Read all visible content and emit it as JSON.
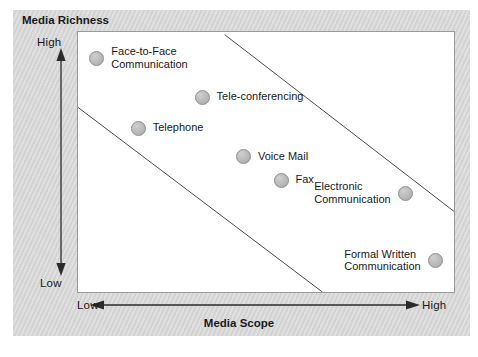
{
  "figure": {
    "richness_axis_title": "Media Richness",
    "scope_axis_title": "Media Scope",
    "y_high": "High",
    "y_low": "Low",
    "x_low": "Low",
    "x_high": "High",
    "caption": "",
    "colors": {
      "frame": "#d6d6d6",
      "panel": "#ffffff",
      "panel_border": "#9a9a9a",
      "marker_fill": "#b8b8b8",
      "marker_border": "#8e8e8e",
      "line": "#4d4d4d",
      "text": "#1a1a1a"
    }
  },
  "chart_data": {
    "type": "scatter",
    "title": "",
    "xlabel": "Media Scope",
    "ylabel": "Media Richness",
    "xlim": [
      "Low",
      "High"
    ],
    "ylim": [
      "Low",
      "High"
    ],
    "xticklabels": [
      "Low",
      "High"
    ],
    "yticklabels": [
      "Low",
      "High"
    ],
    "grid": false,
    "legend": "none",
    "annotation": "Two parallel diagonal boundary lines enclose a band running from upper-left (high richness, low scope) to lower-right (low richness, high scope), indicating the inverse trade-off between media richness and media scope.",
    "points": [
      {
        "label": "Face-to-Face\nCommunication",
        "x": 0.05,
        "y": 0.9,
        "label_side": "right"
      },
      {
        "label": "Tele-conferencing",
        "x": 0.33,
        "y": 0.75,
        "label_side": "right"
      },
      {
        "label": "Telephone",
        "x": 0.16,
        "y": 0.63,
        "label_side": "right"
      },
      {
        "label": "Voice Mail",
        "x": 0.44,
        "y": 0.52,
        "label_side": "right"
      },
      {
        "label": "Fax",
        "x": 0.54,
        "y": 0.43,
        "label_side": "right"
      },
      {
        "label": "Electronic\nCommunication",
        "x": 0.87,
        "y": 0.38,
        "label_side": "left"
      },
      {
        "label": "Formal Written\nCommunication",
        "x": 0.95,
        "y": 0.12,
        "label_side": "left"
      }
    ],
    "boundary_lines": [
      {
        "name": "upper-boundary",
        "x0": 0.39,
        "y0": 0.99,
        "x1": 1.0,
        "y1": 0.31
      },
      {
        "name": "lower-boundary",
        "x0": 0.0,
        "y0": 0.71,
        "x1": 0.65,
        "y1": 0.0
      }
    ]
  }
}
